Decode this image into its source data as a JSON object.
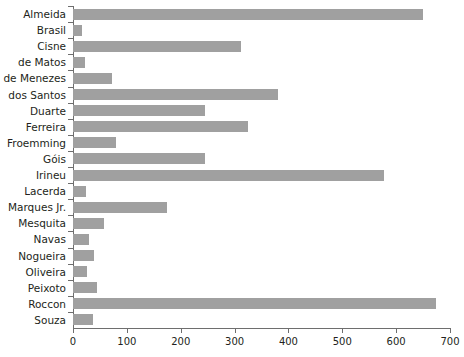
{
  "chart_data": {
    "type": "bar",
    "orientation": "horizontal",
    "title": "",
    "subtitle": "",
    "xlabel": "",
    "ylabel": "",
    "xlim": [
      0,
      700
    ],
    "ylim": null,
    "grid": false,
    "legend": null,
    "legend_position": "none",
    "bar_color": "#a0a0a0",
    "axis_color": "#6e6e6e",
    "text_color": "#231f20",
    "background_color": "#ffffff",
    "xticks": [
      0,
      100,
      200,
      300,
      400,
      500,
      600,
      700
    ],
    "xtick_labels": [
      "0",
      "100",
      "200",
      "300",
      "400",
      "500",
      "600",
      "700"
    ],
    "categories": [
      "Almeida",
      "Brasil",
      "Cisne",
      "de Matos",
      "de Menezes",
      "dos Santos",
      "Duarte",
      "Ferreira",
      "Froemming",
      "Góis",
      "Irineu",
      "Lacerda",
      "Marques Jr.",
      "Mesquita",
      "Navas",
      "Nogueira",
      "Oliveira",
      "Peixoto",
      "Roccon",
      "Souza"
    ],
    "values": [
      650,
      16,
      312,
      23,
      72,
      380,
      245,
      325,
      80,
      246,
      578,
      24,
      174,
      58,
      30,
      39,
      26,
      45,
      674,
      37
    ]
  }
}
